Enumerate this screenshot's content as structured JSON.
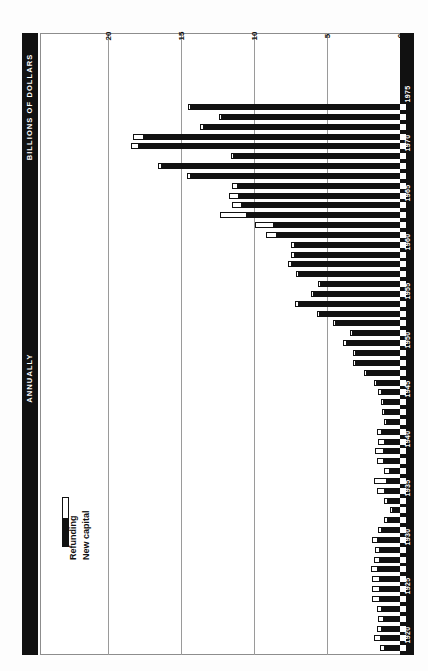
{
  "titles": {
    "units": "BILLIONS OF DOLLARS",
    "frequency": "ANNUALLY"
  },
  "legend": {
    "refunding_label": "Refunding",
    "new_capital_label": "New capital",
    "refunding_color": "#ffffff",
    "new_capital_color": "#111111"
  },
  "chart_data": {
    "type": "bar",
    "orientation": "horizontal-rotated",
    "title": "BILLIONS OF DOLLARS",
    "subtitle": "ANNUALLY",
    "xlabel": "",
    "ylabel": "BILLIONS OF DOLLARS",
    "value_axis_ticks": [
      20,
      15,
      10,
      5,
      0
    ],
    "value_axis_tick_labels": [
      "20",
      "15",
      "10",
      "5",
      "0"
    ],
    "vlim": [
      0,
      20
    ],
    "grid": true,
    "legend_position": "lower-left",
    "category_axis_labels": [
      "1920",
      "1925",
      "1930",
      "1935",
      "1940",
      "1945",
      "1950",
      "1955",
      "1960",
      "1965",
      "1970",
      "1975"
    ],
    "series": [
      {
        "name": "New capital",
        "color": "#111111"
      },
      {
        "name": "Refunding",
        "color": "#ffffff"
      }
    ],
    "categories": [
      1919,
      1920,
      1921,
      1922,
      1923,
      1924,
      1925,
      1926,
      1927,
      1928,
      1929,
      1930,
      1931,
      1932,
      1933,
      1934,
      1935,
      1936,
      1937,
      1938,
      1939,
      1940,
      1941,
      1942,
      1943,
      1944,
      1945,
      1946,
      1947,
      1948,
      1949,
      1950,
      1951,
      1952,
      1953,
      1954,
      1955,
      1956,
      1957,
      1958,
      1959,
      1960,
      1961,
      1962,
      1963,
      1964,
      1965,
      1966,
      1967,
      1968,
      1969,
      1970,
      1971,
      1972,
      1973,
      1974
    ],
    "new_capital": [
      1.0,
      1.3,
      1.2,
      1.1,
      1.2,
      1.4,
      1.4,
      1.4,
      1.5,
      1.4,
      1.4,
      1.5,
      1.2,
      0.8,
      0.5,
      0.8,
      1.0,
      0.9,
      0.7,
      1.1,
      1.1,
      1.0,
      1.2,
      0.9,
      1.0,
      1.1,
      1.2,
      1.6,
      2.3,
      3.0,
      3.0,
      3.6,
      3.2,
      4.4,
      5.5,
      6.9,
      5.9,
      5.4,
      6.9,
      7.4,
      7.2,
      7.2,
      8.4,
      8.6,
      10.5,
      10.8,
      11.0,
      11.1,
      14.3,
      16.3,
      11.4,
      17.9,
      17.5,
      13.4,
      12.2,
      14.3
    ],
    "refunding": [
      0.4,
      0.5,
      0.4,
      0.4,
      0.4,
      0.5,
      0.5,
      0.5,
      0.5,
      0.4,
      0.3,
      0.4,
      0.3,
      0.3,
      0.2,
      0.3,
      0.6,
      0.9,
      0.4,
      0.5,
      0.6,
      0.5,
      0.4,
      0.2,
      0.2,
      0.2,
      0.3,
      0.2,
      0.2,
      0.2,
      0.2,
      0.3,
      0.2,
      0.2,
      0.2,
      0.3,
      0.2,
      0.2,
      0.2,
      0.3,
      0.3,
      0.3,
      0.8,
      1.3,
      1.8,
      0.7,
      0.7,
      0.4,
      0.3,
      0.3,
      0.2,
      0.5,
      0.8,
      0.3,
      0.2,
      0.2
    ]
  }
}
